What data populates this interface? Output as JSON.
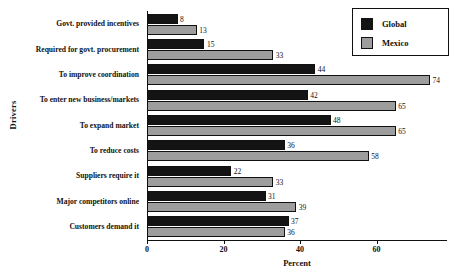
{
  "chart_data": {
    "type": "bar",
    "orientation": "horizontal",
    "title": "",
    "xlabel": "Percent",
    "ylabel": "Drivers",
    "xlim": [
      0,
      78
    ],
    "xticks": [
      0,
      20,
      40,
      60
    ],
    "grid": false,
    "legend_position": "top-right",
    "categories": [
      "Govt. provided incentives",
      "Required for govt. procurement",
      "To improve coordination",
      "To enter new business/markets",
      "To expand market",
      "To reduce costs",
      "Suppliers require it",
      "Major competitors online",
      "Customers demand it"
    ],
    "series": [
      {
        "name": "Global",
        "color": "#141414",
        "values": [
          8,
          15,
          44,
          42,
          48,
          36,
          22,
          31,
          37
        ]
      },
      {
        "name": "Mexico",
        "color": "#9d9d9d",
        "values": [
          13,
          33,
          74,
          65,
          65,
          58,
          33,
          39,
          36
        ]
      }
    ]
  }
}
